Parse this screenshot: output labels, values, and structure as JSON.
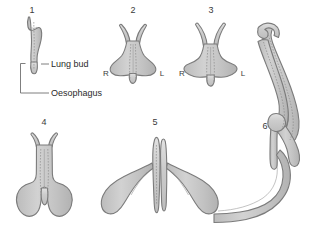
{
  "figure": {
    "background_color": "#ffffff",
    "organ_fill": "#c6c6c6",
    "organ_fill_light": "#d6d6d6",
    "organ_stroke": "#7b7b7b",
    "text_color": "#2b2b2b",
    "leader_color": "#707070"
  },
  "callouts": [
    {
      "id": "lung-bud",
      "label": "Lung bud"
    },
    {
      "id": "oesophagus",
      "label": "Oesophagus"
    }
  ],
  "panels": [
    {
      "id": "panel-1",
      "number": "1",
      "number_x": 32,
      "number_y": 13,
      "side_labels": []
    },
    {
      "id": "panel-2",
      "number": "2",
      "number_x": 133,
      "number_y": 13,
      "side_labels": [
        {
          "text": "R",
          "x": 106,
          "y": 76
        },
        {
          "text": "L",
          "x": 162,
          "y": 76
        }
      ]
    },
    {
      "id": "panel-3",
      "number": "3",
      "number_x": 211,
      "number_y": 13,
      "side_labels": [
        {
          "text": "R",
          "x": 182,
          "y": 76
        },
        {
          "text": "L",
          "x": 243,
          "y": 76
        }
      ]
    },
    {
      "id": "panel-4",
      "number": "4",
      "number_x": 44,
      "number_y": 125,
      "side_labels": []
    },
    {
      "id": "panel-5",
      "number": "5",
      "number_x": 155,
      "number_y": 125,
      "side_labels": []
    },
    {
      "id": "panel-6",
      "number": "6",
      "number_x": 265,
      "number_y": 129,
      "side_labels": []
    }
  ]
}
